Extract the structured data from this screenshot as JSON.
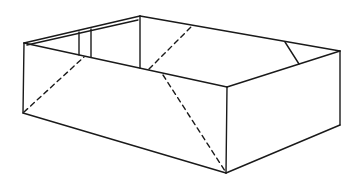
{
  "figure": {
    "stroke_color": "#1a1a1a",
    "background": "#ffffff"
  }
}
